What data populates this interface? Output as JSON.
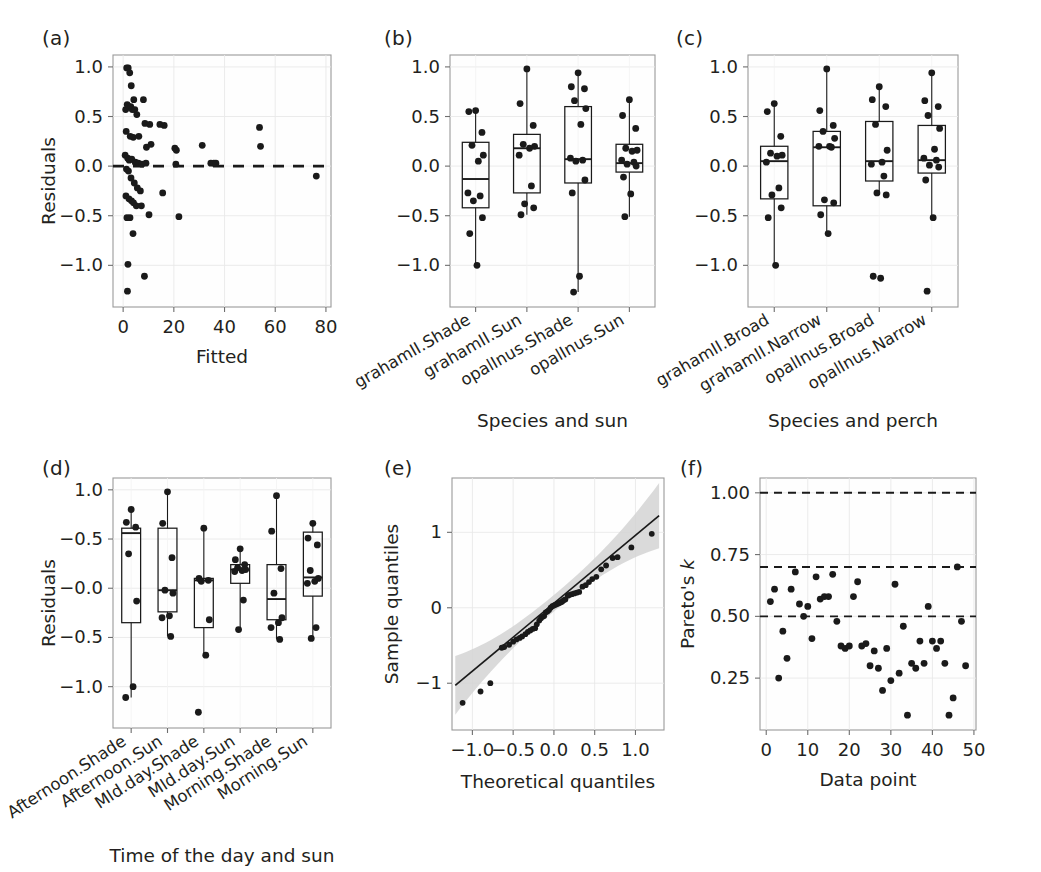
{
  "figure": {
    "panels": [
      "(a)",
      "(b)",
      "(c)",
      "(d)",
      "(e)",
      "(f)"
    ]
  },
  "chart_data": [
    {
      "panel": "(a)",
      "type": "scatter",
      "title": "",
      "xlabel": "Fitted",
      "ylabel": "Residuals",
      "xlim": [
        -4,
        82
      ],
      "ylim": [
        -1.42,
        1.12
      ],
      "xticks": [
        0,
        20,
        40,
        60,
        80
      ],
      "yticks": [
        -1.0,
        -0.5,
        0.0,
        0.5,
        1.0
      ],
      "ytick_labels": [
        "-1.0",
        "-0.5",
        "0.0",
        "0.5",
        "1.0"
      ],
      "grid": true,
      "legend": "none",
      "annotations": [
        {
          "type": "hline",
          "y": 0.0,
          "style": "dashed",
          "label": "zero residual reference"
        }
      ],
      "x": [
        1.4,
        2.0,
        2.6,
        3.2,
        4.2,
        8.0,
        1.0,
        1.6,
        2.2,
        3.0,
        3.6,
        4.6,
        5.4,
        8.6,
        10.5,
        14.5,
        16.2,
        1.2,
        2.8,
        4.0,
        6.2,
        9.2,
        11.0,
        20.4,
        21.0,
        31.2,
        53.8,
        54.2,
        0.8,
        1.8,
        2.4,
        3.4,
        4.8,
        5.0,
        6.0,
        7.4,
        9.0,
        20.8,
        34.6,
        35.8,
        36.6,
        1.3,
        2.1,
        3.1,
        4.4,
        5.6,
        6.8,
        15.6,
        76.2,
        1.1,
        2.3,
        3.3,
        4.1,
        5.2,
        7.2,
        10.2,
        22.0,
        1.5,
        2.7,
        3.9,
        1.9,
        8.4,
        1.7
      ],
      "y": [
        0.99,
        0.99,
        0.94,
        0.81,
        0.67,
        0.67,
        0.57,
        0.62,
        0.6,
        0.6,
        0.57,
        0.57,
        0.52,
        0.43,
        0.42,
        0.42,
        0.41,
        0.35,
        0.3,
        0.29,
        0.3,
        0.19,
        0.22,
        0.18,
        0.16,
        0.21,
        0.39,
        0.2,
        0.11,
        0.08,
        0.06,
        0.07,
        0.04,
        0.03,
        0.03,
        0.02,
        0.03,
        0.02,
        0.03,
        0.03,
        0.03,
        -0.03,
        -0.05,
        -0.12,
        -0.17,
        -0.22,
        -0.25,
        -0.27,
        -0.1,
        -0.3,
        -0.33,
        -0.35,
        -0.37,
        -0.4,
        -0.4,
        -0.49,
        -0.51,
        -0.52,
        -0.52,
        -0.68,
        -0.99,
        -1.11,
        -1.26
      ]
    },
    {
      "panel": "(b)",
      "type": "box",
      "title": "",
      "xlabel": "Species and sun",
      "ylabel": "",
      "ylim": [
        -1.42,
        1.12
      ],
      "yticks": [
        -1.0,
        -0.5,
        0.0,
        0.5,
        1.0
      ],
      "ytick_labels": [
        "-1.0",
        "-0.5",
        "0.0",
        "0.5",
        "1.0"
      ],
      "grid": true,
      "legend": "none",
      "categories": [
        "grahamII.Shade",
        "grahamII.Sun",
        "opalInus.Shade",
        "opalInus.Sun"
      ],
      "boxes": [
        {
          "name": "grahamII.Shade",
          "min": -1.0,
          "q1": -0.42,
          "median": -0.13,
          "q3": 0.24,
          "max": 0.56,
          "points": [
            0.56,
            0.55,
            0.34,
            0.21,
            0.11,
            0.05,
            -0.27,
            -0.3,
            -0.35,
            -0.52,
            -0.68,
            -1.0
          ]
        },
        {
          "name": "grahamII.Sun",
          "min": -0.49,
          "q1": -0.27,
          "median": 0.18,
          "q3": 0.32,
          "max": 0.98,
          "points": [
            0.98,
            0.63,
            0.41,
            0.22,
            0.2,
            0.18,
            0.11,
            -0.2,
            -0.38,
            -0.42,
            -0.49
          ]
        },
        {
          "name": "opalInus.Shade",
          "min": -1.27,
          "q1": -0.17,
          "median": 0.07,
          "q3": 0.6,
          "max": 0.94,
          "points": [
            0.94,
            0.8,
            0.78,
            0.66,
            0.58,
            0.42,
            0.08,
            0.06,
            0.05,
            -0.14,
            -0.27,
            -1.11,
            -1.27
          ]
        },
        {
          "name": "opalInus.Sun",
          "min": -0.51,
          "q1": -0.06,
          "median": 0.03,
          "q3": 0.22,
          "max": 0.67,
          "points": [
            0.67,
            0.51,
            0.38,
            0.18,
            0.16,
            0.15,
            0.06,
            0.04,
            0.02,
            0.0,
            -0.11,
            -0.28,
            -0.51
          ]
        }
      ]
    },
    {
      "panel": "(c)",
      "type": "box",
      "title": "",
      "xlabel": "Species and perch",
      "ylabel": "",
      "ylim": [
        -1.42,
        1.12
      ],
      "yticks": [
        -1.0,
        -0.5,
        0.0,
        0.5,
        1.0
      ],
      "ytick_labels": [
        "-1.0",
        "-0.5",
        "0.0",
        "0.5",
        "1.0"
      ],
      "grid": true,
      "legend": "none",
      "categories": [
        "grahamII.Broad",
        "grahamII.Narrow",
        "opalInus.Broad",
        "opalInus.Narrow"
      ],
      "boxes": [
        {
          "name": "grahamII.Broad",
          "min": -1.0,
          "q1": -0.33,
          "median": 0.05,
          "q3": 0.2,
          "max": 0.63,
          "points": [
            0.63,
            0.55,
            0.3,
            0.13,
            0.11,
            0.1,
            0.04,
            -0.22,
            -0.29,
            -0.42,
            -0.52,
            -1.0
          ]
        },
        {
          "name": "grahamII.Narrow",
          "min": -0.68,
          "q1": -0.4,
          "median": 0.19,
          "q3": 0.35,
          "max": 0.98,
          "points": [
            0.98,
            0.56,
            0.41,
            0.35,
            0.28,
            0.2,
            0.2,
            0.19,
            -0.34,
            -0.37,
            -0.49,
            -0.68
          ]
        },
        {
          "name": "opalInus.Broad",
          "min": -0.29,
          "q1": -0.15,
          "median": 0.05,
          "q3": 0.45,
          "max": 0.8,
          "points": [
            0.8,
            0.67,
            0.6,
            0.42,
            0.16,
            0.04,
            0.02,
            -0.1,
            -0.27,
            -0.29,
            -1.11,
            -1.13
          ]
        },
        {
          "name": "opalInus.Narrow",
          "min": -0.52,
          "q1": -0.07,
          "median": 0.06,
          "q3": 0.41,
          "max": 0.94,
          "points": [
            0.94,
            0.66,
            0.6,
            0.51,
            0.38,
            0.17,
            0.08,
            0.06,
            0.01,
            -0.01,
            -0.14,
            -0.52,
            -1.26
          ]
        }
      ]
    },
    {
      "panel": "(d)",
      "type": "box",
      "title": "",
      "xlabel": "Time of the day and sun",
      "ylabel": "Residuals",
      "ylim": [
        -1.42,
        1.12
      ],
      "yticks": [
        -1.0,
        -0.5,
        0.0,
        0.5,
        1.0
      ],
      "ytick_labels": [
        "-1.0",
        "-0.5",
        "-0.0",
        "-0.5",
        "1.0"
      ],
      "grid": true,
      "legend": "none",
      "categories": [
        "Afternoon.Shade",
        "Afternoon.Sun",
        "MId.day.Shade",
        "MId.day.Sun",
        "Morning.Shade",
        "Morning.Sun"
      ],
      "boxes": [
        {
          "name": "Afternoon.Shade",
          "min": -1.11,
          "q1": -0.35,
          "median": 0.56,
          "q3": 0.61,
          "max": 0.8,
          "points": [
            0.8,
            0.67,
            0.62,
            0.35,
            -0.13,
            -1.0,
            -1.11
          ]
        },
        {
          "name": "Afternoon.Sun",
          "min": -0.49,
          "q1": -0.24,
          "median": -0.02,
          "q3": 0.61,
          "max": 0.98,
          "points": [
            0.98,
            0.66,
            0.31,
            -0.02,
            -0.05,
            -0.28,
            -0.3,
            -0.49
          ]
        },
        {
          "name": "MId.day.Shade",
          "min": -0.68,
          "q1": -0.4,
          "median": 0.08,
          "q3": 0.1,
          "max": 0.61,
          "points": [
            0.61,
            0.1,
            0.08,
            0.07,
            -0.32,
            -0.68,
            -1.26
          ]
        },
        {
          "name": "MId.day.Sun",
          "min": -0.42,
          "q1": 0.05,
          "median": 0.19,
          "q3": 0.24,
          "max": 0.4,
          "points": [
            0.4,
            0.29,
            0.24,
            0.21,
            0.19,
            0.18,
            0.17,
            -0.12,
            -0.42
          ]
        },
        {
          "name": "Morning.Shade",
          "min": -0.52,
          "q1": -0.32,
          "median": -0.11,
          "q3": 0.24,
          "max": 0.94,
          "points": [
            0.94,
            0.58,
            0.2,
            -0.05,
            -0.3,
            -0.35,
            -0.4,
            -0.52
          ]
        },
        {
          "name": "Morning.Sun",
          "min": -0.51,
          "q1": -0.08,
          "median": 0.11,
          "q3": 0.57,
          "max": 0.66,
          "points": [
            0.66,
            0.51,
            0.44,
            0.18,
            0.1,
            0.07,
            0.05,
            -0.4,
            -0.51
          ]
        }
      ]
    },
    {
      "panel": "(e)",
      "type": "scatter",
      "title": "",
      "xlabel": "Theoretical quantiles",
      "ylabel": "Sample quantiles",
      "xlim": [
        -1.25,
        1.35
      ],
      "ylim": [
        -1.62,
        1.72
      ],
      "xticks": [
        -1.0,
        -0.5,
        0.0,
        0.5,
        1.0
      ],
      "xtick_labels": [
        "-1.0",
        "-0.5",
        "0.0",
        "0.5",
        "1.0"
      ],
      "yticks": [
        -1,
        0,
        1
      ],
      "ytick_labels": [
        "-1",
        "0",
        "1"
      ],
      "grid": true,
      "legend": "none",
      "annotations": [
        {
          "type": "band",
          "label": "95% confidence band",
          "color": "#d4d4d4"
        },
        {
          "type": "line",
          "label": "reference line"
        }
      ],
      "x": [
        -1.12,
        -0.9,
        -0.78,
        -0.64,
        -0.61,
        -0.55,
        -0.5,
        -0.46,
        -0.42,
        -0.39,
        -0.35,
        -0.32,
        -0.29,
        -0.26,
        -0.23,
        -0.21,
        -0.18,
        -0.16,
        -0.14,
        -0.12,
        -0.1,
        -0.08,
        -0.06,
        -0.04,
        -0.02,
        0.0,
        0.02,
        0.04,
        0.06,
        0.08,
        0.1,
        0.12,
        0.14,
        0.17,
        0.19,
        0.22,
        0.25,
        0.28,
        0.31,
        0.35,
        0.39,
        0.43,
        0.47,
        0.52,
        0.58,
        0.64,
        0.72,
        0.78,
        0.95,
        1.2
      ],
      "y": [
        -1.26,
        -1.11,
        -1.0,
        -0.53,
        -0.52,
        -0.49,
        -0.45,
        -0.42,
        -0.4,
        -0.38,
        -0.35,
        -0.32,
        -0.3,
        -0.28,
        -0.27,
        -0.22,
        -0.17,
        -0.14,
        -0.12,
        -0.11,
        -0.06,
        -0.05,
        -0.03,
        0.0,
        0.02,
        0.03,
        0.04,
        0.05,
        0.06,
        0.07,
        0.08,
        0.1,
        0.11,
        0.16,
        0.17,
        0.18,
        0.19,
        0.2,
        0.21,
        0.28,
        0.3,
        0.34,
        0.38,
        0.41,
        0.51,
        0.56,
        0.66,
        0.67,
        0.8,
        0.98
      ]
    },
    {
      "panel": "(f)",
      "type": "scatter",
      "title": "",
      "xlabel": "Data point",
      "ylabel": "Pareto's k",
      "ylabel_italic_part": "k",
      "xlim": [
        -1.5,
        50.5
      ],
      "ylim": [
        0.04,
        1.06
      ],
      "xticks": [
        0,
        10,
        20,
        30,
        40,
        50
      ],
      "yticks": [
        0.25,
        0.5,
        0.75,
        1.0
      ],
      "ytick_labels": [
        "0.25",
        "0.50",
        "0.75",
        "1.00"
      ],
      "grid": true,
      "legend": "none",
      "annotations": [
        {
          "type": "hline",
          "y": 1.0,
          "style": "dashed"
        },
        {
          "type": "hline",
          "y": 0.7,
          "style": "dashed"
        },
        {
          "type": "hline",
          "y": 0.5,
          "style": "dashed"
        }
      ],
      "x": [
        1,
        2,
        3,
        4,
        5,
        6,
        7,
        8,
        9,
        10,
        11,
        12,
        13,
        14,
        15,
        16,
        17,
        18,
        19,
        20,
        21,
        22,
        23,
        24,
        25,
        26,
        27,
        28,
        29,
        30,
        31,
        32,
        33,
        34,
        35,
        36,
        37,
        38,
        39,
        40,
        41,
        42,
        43,
        44,
        45,
        46,
        47,
        48
      ],
      "y": [
        0.56,
        0.61,
        0.25,
        0.44,
        0.33,
        0.61,
        0.68,
        0.55,
        0.5,
        0.54,
        0.41,
        0.66,
        0.57,
        0.58,
        0.58,
        0.67,
        0.48,
        0.38,
        0.37,
        0.38,
        0.58,
        0.64,
        0.38,
        0.39,
        0.3,
        0.36,
        0.29,
        0.2,
        0.37,
        0.24,
        0.63,
        0.27,
        0.46,
        0.1,
        0.31,
        0.29,
        0.4,
        0.31,
        0.54,
        0.4,
        0.37,
        0.4,
        0.31,
        0.1,
        0.17,
        0.7,
        0.48,
        0.3
      ]
    }
  ]
}
